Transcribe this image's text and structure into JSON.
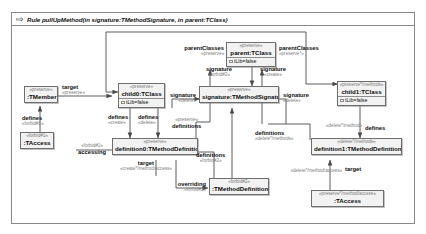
{
  "rule": {
    "icon": "rule-arrow-icon",
    "title": "Rule pullUpMethod(in signature:TMethodSignature, in parent:TClass)"
  },
  "nodes": [
    {
      "id": "tmember",
      "stereotype": "«preserve»",
      "name": ":TMember",
      "attr": null
    },
    {
      "id": "taccess_left",
      "stereotype": "«forbid#1»",
      "name": ":TAccess",
      "attr": null
    },
    {
      "id": "child0",
      "stereotype": "«preserve»",
      "name": "child0:TClass",
      "attr": "tLib=false"
    },
    {
      "id": "definition0",
      "stereotype": "«preserve»",
      "name": "definition0:TMethodDefinition",
      "attr": null
    },
    {
      "id": "parent",
      "stereotype": "«preserve»",
      "name": "parent:TClass",
      "attr": "tLib=false"
    },
    {
      "id": "signature",
      "stereotype": "«preserve»",
      "name": "signature:TMethodSignature",
      "attr": null
    },
    {
      "id": "child1",
      "stereotype": "«preserve*/methods»",
      "name": "child1:TClass",
      "attr": "tLib=false"
    },
    {
      "id": "definition1",
      "stereotype": "«delete*/methods»",
      "name": "definition1:TMethodDefinition",
      "attr": null
    },
    {
      "id": "forbid_def",
      "stereotype": "«forbid#2»",
      "name": ":TMethodDefinition",
      "attr": null
    },
    {
      "id": "taccess_right",
      "stereotype": "«preserve*/method/access»",
      "name": ":TAccess",
      "attr": null
    }
  ],
  "edge_labels": [
    {
      "id": "l-target-tmember",
      "role": "target",
      "stereotype": "«preserve»"
    },
    {
      "id": "l-defines-forbid1",
      "role": "defines",
      "stereotype": "«forbid#1»"
    },
    {
      "id": "l-accessing",
      "role": "accessing",
      "stereotype": "«forbid#1»"
    },
    {
      "id": "l-defines-create",
      "role": "defines",
      "stereotype": "«create»"
    },
    {
      "id": "l-defines-delete",
      "role": "defines",
      "stereotype": "«delete»"
    },
    {
      "id": "l-parentclasses-left",
      "role": "parentClasses",
      "stereotype": "«preserve»"
    },
    {
      "id": "l-parentclasses-right",
      "role": "parentClasses",
      "stereotype": "«preserve*»"
    },
    {
      "id": "l-signature-forbid",
      "role": "signature",
      "stereotype": "«forbid#2»"
    },
    {
      "id": "l-signature-create",
      "role": "signature",
      "stereotype": "«create»"
    },
    {
      "id": "l-signature-delete",
      "role": "signature",
      "stereotype": "«delete»"
    },
    {
      "id": "l-signature-del2",
      "role": "signature",
      "stereotype": "«delete»"
    },
    {
      "id": "l-definitions-pres",
      "role": "definitions",
      "stereotype": "«preserve»"
    },
    {
      "id": "l-definitions-forbid2",
      "role": "definitions",
      "stereotype": "«forbid#2»"
    },
    {
      "id": "l-definitions-del",
      "role": "definitions",
      "stereotype": "«delete*/methods»"
    },
    {
      "id": "l-defines-right",
      "role": "defines",
      "stereotype": "«delete*/method»"
    },
    {
      "id": "l-overriding",
      "role": "overriding",
      "stereotype": "«forbid#2»"
    },
    {
      "id": "l-target-left",
      "role": "target",
      "stereotype": "«create*/method/access»"
    },
    {
      "id": "l-target-right",
      "role": "target",
      "stereotype": "«delete*/method/access»"
    },
    {
      "id": "l-access-pres",
      "role": "",
      "stereotype": "«preserve*/method/access»"
    }
  ],
  "colors": {
    "node_fill": "#f2f2f2",
    "node_border": "#6e6e6e",
    "frame_border": "#8a8a8a",
    "edge": "#4a4a4a",
    "stereotype_text": "#7b7b7b",
    "name_text": "#0b0b0b"
  }
}
